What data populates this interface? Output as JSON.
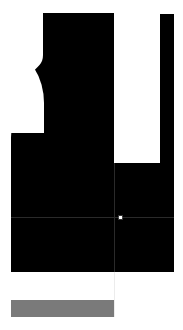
{
  "window": {
    "title": "Media Player",
    "background_color": "#ffffff"
  },
  "hero": {
    "name": "video-canvas",
    "color": "#000000"
  },
  "side_rail": {
    "name": "right-rail",
    "color": "#000000"
  },
  "panel_grid": {
    "color": "#000000",
    "divider_color": "#2a2a2a",
    "panels": [
      {
        "label": "",
        "caption": ""
      },
      {
        "label": "",
        "caption": ""
      },
      {
        "label": "",
        "caption": ""
      },
      {
        "label": "",
        "caption": ""
      }
    ],
    "captions": {
      "top_right_fragment": "",
      "mid_left_fragment": ""
    }
  },
  "center_marker": {
    "color": "#ffffff",
    "x": 120,
    "y": 217
  },
  "status_bar": {
    "text": "",
    "color": "#7a7a7a"
  },
  "guide": {
    "color": "#ececec"
  }
}
